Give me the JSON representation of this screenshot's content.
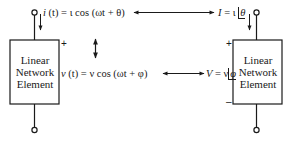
{
  "left_element": {
    "label_line1": "Linear",
    "label_line2": "Network",
    "label_line3": "Element",
    "plus_sign": "+"
  },
  "right_element": {
    "label_line1": "Linear",
    "label_line2": "Network",
    "label_line3": "Element",
    "plus_sign": "+",
    "minus_sign": "–"
  },
  "time_domain": {
    "current_var": "i",
    "current_rest": " (t) = ι cos (ωt + θ)",
    "voltage_var": "v",
    "voltage_rest": " (t) = ν  cos (ωt + φ)"
  },
  "phasor_domain": {
    "current_lhs": "I",
    "current_eq": " = ι ",
    "current_angle": "θ",
    "voltage_lhs": "V",
    "voltage_eq": " = ν",
    "voltage_angle": "φ"
  },
  "arrows": {
    "current_correspondence": "double-headed horizontal arrow",
    "voltage_correspondence": "double-headed horizontal arrow",
    "domain_link": "double-headed vertical arrow"
  },
  "colors": {
    "ink": "#1a1a1a",
    "background": "#ffffff"
  }
}
